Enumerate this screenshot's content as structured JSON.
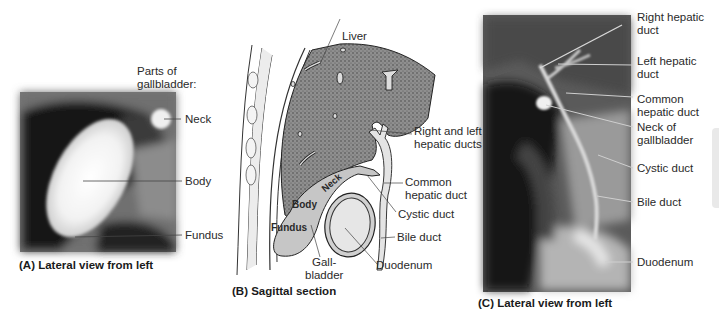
{
  "figure": {
    "panels": [
      {
        "id": "A",
        "caption": "(A) Lateral view from left",
        "header": [
          "Parts of",
          "gallbladder:"
        ],
        "labels": [
          "Neck",
          "Body",
          "Fundus"
        ]
      },
      {
        "id": "B",
        "caption": "(B) Sagittal section",
        "labels": {
          "liver": "Liver",
          "hepatic_ducts": [
            "Right and left",
            "hepatic ducts"
          ],
          "common_hepatic": [
            "Common",
            "hepatic duct"
          ],
          "cystic": "Cystic duct",
          "bile": "Bile duct",
          "duodenum": "Duodenum",
          "gallbladder": [
            "Gall-",
            "bladder"
          ],
          "neck": "Neck",
          "body": "Body",
          "fundus": "Fundus"
        }
      },
      {
        "id": "C",
        "caption": "(C) Lateral view from left",
        "labels": {
          "right_hepatic": [
            "Right hepatic",
            "duct"
          ],
          "left_hepatic": [
            "Left hepatic",
            "duct"
          ],
          "common_hepatic": [
            "Common",
            "hepatic duct"
          ],
          "neck_gb": [
            "Neck of",
            "gallbladder"
          ],
          "cystic": "Cystic duct",
          "bile": "Bile duct",
          "duodenum": "Duodenum"
        }
      }
    ],
    "colors": {
      "liver_fill": "#8a8a8a",
      "gallbladder_fill": "#c8c8c8",
      "duct_fill": "#e2e2e2",
      "radiograph_dark": "#1c1c1c",
      "radiograph_light": "#f2f2f2"
    }
  }
}
